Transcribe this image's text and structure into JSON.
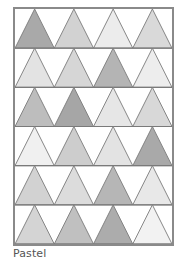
{
  "pattern": {
    "name": "Pastel",
    "rows": 6,
    "cols": 4,
    "line_color": "#7a7a7a",
    "frame_color": "#8a8a8a",
    "background": "#ffffff",
    "colors": [
      [
        "#a9a9a9",
        "#d2d2d2",
        "#ececec",
        "#d9d9d9"
      ],
      [
        "#e3e3e3",
        "#d6d6d6",
        "#b4b4b4",
        "#ededed"
      ],
      [
        "#bdbdbd",
        "#a6a6a6",
        "#e6e6e6",
        "#d8d8d8"
      ],
      [
        "#f0f0f0",
        "#cdcdcd",
        "#e3e3e3",
        "#a9a9a9"
      ],
      [
        "#d2d2d2",
        "#dcdcdc",
        "#b6b6b6",
        "#e8e8e8"
      ],
      [
        "#d4d4d4",
        "#c0c0c0",
        "#acacac",
        "#f2f2f2"
      ]
    ]
  }
}
